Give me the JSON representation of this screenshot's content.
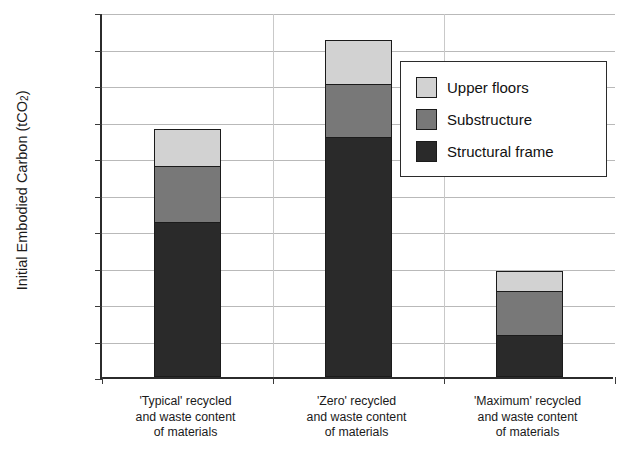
{
  "chart_data": {
    "type": "bar",
    "subtype": "stacked-column",
    "title": "",
    "xlabel": "",
    "ylabel": "Initial Embodied Carbon (tCO2)",
    "ylabel_parts": {
      "main": "Initial Embodied Carbon (tCO",
      "sub": "2",
      "tail": ")"
    },
    "ylim": [
      0,
      50000
    ],
    "ytick_step": 5000,
    "ytick_labels": [
      "50,000",
      "45,000",
      "40,000",
      "35,000",
      "30,000",
      "25,000",
      "20,000",
      "15,000",
      "10,000",
      "5,000",
      "0"
    ],
    "ytick_values": [
      50000,
      45000,
      40000,
      35000,
      30000,
      25000,
      20000,
      15000,
      10000,
      5000,
      0
    ],
    "grid": true,
    "grid_axis": "y",
    "legend_position": "top-right",
    "categories": [
      "'Typical' recycled and waste content of materials",
      "'Zero' recycled and waste content of materials",
      "'Maximum' recycled and waste content of materials"
    ],
    "category_label_lines": [
      [
        "'Typical' recycled",
        "and waste content",
        "of materials"
      ],
      [
        "'Zero' recycled",
        "and waste content",
        "of materials"
      ],
      [
        "'Maximum' recycled",
        "and waste content",
        "of materials"
      ]
    ],
    "series": [
      {
        "name": "Structural frame",
        "color": "#2a2a2a",
        "values": [
          21200,
          32900,
          5750
        ]
      },
      {
        "name": "Substructure",
        "color": "#787878",
        "values": [
          7800,
          7400,
          6150
        ]
      },
      {
        "name": "Upper floors",
        "color": "#d2d2d2",
        "values": [
          5300,
          6100,
          2900
        ]
      }
    ],
    "totals": [
      34300,
      46400,
      14800
    ],
    "legend_entries": [
      {
        "label": "Upper floors",
        "color": "#d2d2d2"
      },
      {
        "label": "Substructure",
        "color": "#787878"
      },
      {
        "label": "Structural frame",
        "color": "#2a2a2a"
      }
    ]
  }
}
